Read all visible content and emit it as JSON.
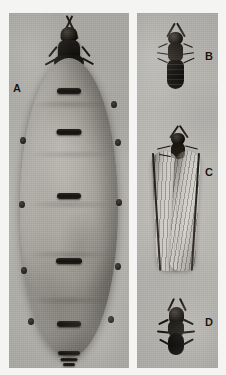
{
  "plate": {
    "kind": "photographic-plate",
    "background_color": "#fdfdfb",
    "panel_tone": "#b5b3ae",
    "panels": [
      {
        "id": "panel-a",
        "label": "A",
        "subject": "physogastric termite queen, dorsal view",
        "position": {
          "x": 9,
          "y": 13,
          "width": 120,
          "height": 355
        }
      },
      {
        "id": "panel-bcd",
        "label": "B, C, D",
        "subject": "termite castes column",
        "position": {
          "x": 137,
          "y": 13,
          "width": 81,
          "height": 355
        }
      }
    ],
    "specimens": [
      {
        "letter": "A",
        "name": "queen-physogastric",
        "description": "greatly swollen egg-laying queen with small dark head and thorax"
      },
      {
        "letter": "B",
        "name": "soldier",
        "description": "dark elongate termite, wingless"
      },
      {
        "letter": "C",
        "name": "alate",
        "description": "winged reproductive with two pairs of long pale wings"
      },
      {
        "letter": "D",
        "name": "dealate",
        "description": "shed-winged reproductive, stout dark body"
      }
    ],
    "letters": {
      "a": "A",
      "b": "B",
      "c": "C",
      "d": "D"
    },
    "letter_color": "#17150f"
  }
}
